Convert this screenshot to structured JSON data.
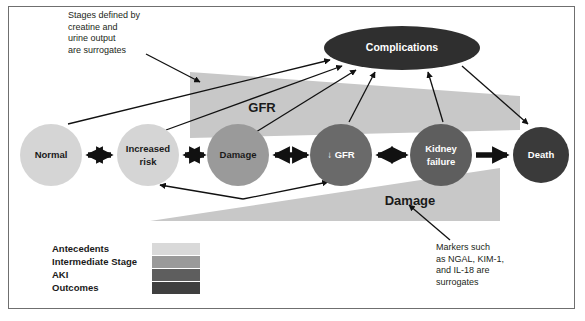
{
  "figure": {
    "background": "#ffffff",
    "frame_color": "#6f6f6f"
  },
  "palette": {
    "antecedents": "#d5d5d5",
    "intermediate_stage": "#9a9a9a",
    "aki": "#5e5e5e",
    "outcomes": "#3a3a3a",
    "band_gfr": "#c8c8c8",
    "band_damage": "#c8c8c8",
    "arrow": "#111111",
    "text_dark": "#1a1a1a",
    "text_light": "#ffffff"
  },
  "nodes": [
    {
      "id": "normal",
      "label": "Normal",
      "label_lines": [
        "Normal"
      ],
      "cx": 51,
      "cy": 155,
      "r": 31,
      "fill": "#d5d5d5",
      "text_class": "node-label-dark"
    },
    {
      "id": "increased-risk",
      "label": "Increased risk",
      "label_lines": [
        "Increased",
        "risk"
      ],
      "cx": 148,
      "cy": 155,
      "r": 31,
      "fill": "#d5d5d5",
      "text_class": "node-label-dark"
    },
    {
      "id": "damage",
      "label": "Damage",
      "label_lines": [
        "Damage"
      ],
      "cx": 238,
      "cy": 155,
      "r": 31,
      "fill": "#9a9a9a",
      "text_class": "node-label-dark"
    },
    {
      "id": "gfr-decline",
      "label": "↓ GFR",
      "label_lines": [
        "↓ GFR"
      ],
      "cx": 341,
      "cy": 155,
      "r": 31,
      "fill": "#6a6a6a",
      "text_class": "node-label-light"
    },
    {
      "id": "kidney-failure",
      "label": "Kidney failure",
      "label_lines": [
        "Kidney",
        "failure"
      ],
      "cx": 441,
      "cy": 155,
      "r": 31,
      "fill": "#5e5e5e",
      "text_class": "node-label-light"
    },
    {
      "id": "death",
      "label": "Death",
      "label_lines": [
        "Death"
      ],
      "cx": 541,
      "cy": 155,
      "r": 28,
      "fill": "#3a3a3a",
      "text_class": "node-label-light"
    }
  ],
  "ellipse": {
    "id": "complications",
    "label": "Complications",
    "cx": 402,
    "cy": 48,
    "rx": 78,
    "ry": 22,
    "fill": "#2f2f2f",
    "text_class": "node-label-light"
  },
  "bands": [
    {
      "id": "gfr-band",
      "label": "GFR",
      "label_x": 262,
      "label_y": 109
    },
    {
      "id": "damage-band",
      "label": "Damage",
      "label_x": 410,
      "label_y": 202
    }
  ],
  "annotations": [
    {
      "id": "stages-note",
      "lines": [
        "Stages defined by",
        "creatine and",
        "urine output",
        "are surrogates"
      ],
      "x": 68,
      "y": 18,
      "line_height": 11.5
    },
    {
      "id": "markers-note",
      "lines": [
        "Markers such",
        "as NGAL, KIM-1,",
        "and IL-18 are",
        "surrogates"
      ],
      "x": 436,
      "y": 250,
      "line_height": 11.5
    }
  ],
  "legend": {
    "x": 52,
    "y": 243,
    "row_height": 13,
    "swatch_x": 152,
    "swatch_width": 48,
    "swatch_height": 12,
    "items": [
      {
        "label": "Antecedents",
        "color": "#d9d9d9"
      },
      {
        "label": "Intermediate Stage",
        "color": "#9a9a9a"
      },
      {
        "label": "AKI",
        "color": "#5e5e5e"
      },
      {
        "label": "Outcomes",
        "color": "#3f3f3f"
      }
    ]
  },
  "connectors": {
    "bidirectional_chain": [
      {
        "from": "normal",
        "to": "increased-risk"
      },
      {
        "from": "increased-risk",
        "to": "damage"
      },
      {
        "from": "damage",
        "to": "gfr-decline"
      },
      {
        "from": "gfr-decline",
        "to": "kidney-failure"
      }
    ],
    "unidirectional": [
      {
        "from": "kidney-failure",
        "to": "death"
      }
    ],
    "to_complications": [
      "increased-risk",
      "damage",
      "gfr-decline",
      "kidney-failure"
    ],
    "from_complications": [
      "death"
    ],
    "recovery_arrows": [
      {
        "to": "increased-risk"
      },
      {
        "to": "gfr-decline"
      }
    ]
  }
}
